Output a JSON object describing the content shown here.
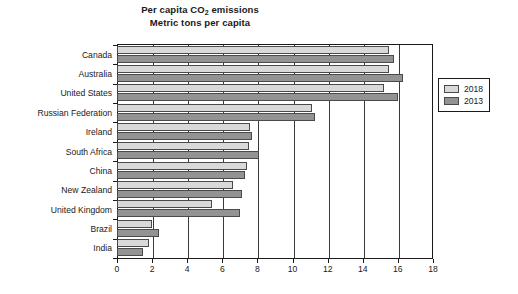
{
  "chart_data": {
    "type": "bar",
    "orientation": "horizontal",
    "title": "Per capita CO2 emissions",
    "subtitle": "Metric tons per capita",
    "title_line1_pre": "Per capita CO",
    "title_line1_sub": "2",
    "title_line1_post": " emissions",
    "xlabel": "",
    "ylabel": "",
    "xlim": [
      0,
      18
    ],
    "xticks": [
      0,
      2,
      4,
      6,
      8,
      10,
      12,
      14,
      16,
      18
    ],
    "grid": true,
    "legend_position": "right",
    "categories": [
      "Canada",
      "Australia",
      "United States",
      "Russian Federation",
      "Ireland",
      "South Africa",
      "China",
      "New Zealand",
      "United Kingdom",
      "Brazil",
      "India"
    ],
    "series": [
      {
        "name": "2018",
        "color": "#d9d9d9",
        "values": [
          15.5,
          15.5,
          15.2,
          11.1,
          7.6,
          7.5,
          7.4,
          6.6,
          5.4,
          2.0,
          1.8
        ]
      },
      {
        "name": "2013",
        "color": "#939393",
        "values": [
          15.8,
          16.3,
          16.0,
          11.3,
          7.7,
          8.1,
          7.3,
          7.1,
          7.0,
          2.4,
          1.5
        ]
      }
    ]
  },
  "legend": {
    "items": [
      {
        "label": "2018",
        "color": "#d9d9d9"
      },
      {
        "label": "2013",
        "color": "#939393"
      }
    ]
  }
}
